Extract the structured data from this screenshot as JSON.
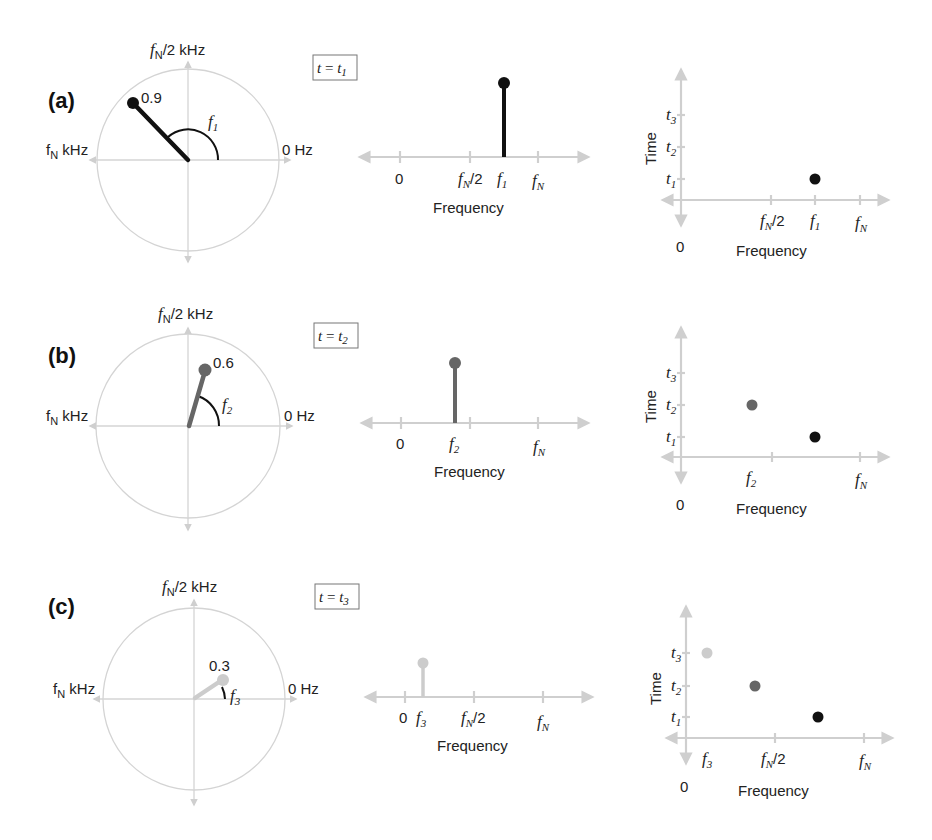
{
  "panels": [
    {
      "id": "a",
      "label": "(a)",
      "time_box": {
        "t": "t",
        "eq": " = ",
        "sub_t": "t",
        "sub": "1"
      },
      "phasor": {
        "top_label_f": "f",
        "top_label_sub": "N",
        "top_label_rest": "/2 kHz",
        "left_label": "f",
        "left_label_sub": "N",
        "left_label_rest": " kHz",
        "right_label": "0 Hz",
        "magnitude": "0.9",
        "angle_label": "f",
        "angle_sub": "1",
        "color": "#111111"
      },
      "spectrum": {
        "ticks": [
          {
            "main": "0",
            "sub": ""
          },
          {
            "main": "f",
            "sub": "N",
            "rest": "/2"
          },
          {
            "main": "f",
            "sub": "1"
          },
          {
            "main": "f",
            "sub": "N"
          }
        ],
        "xlabel": "Frequency"
      },
      "spectrogram": {
        "ylabel": "Time",
        "yticks": [
          {
            "main": "t",
            "sub": "1"
          },
          {
            "main": "t",
            "sub": "2"
          },
          {
            "main": "t",
            "sub": "3"
          }
        ],
        "xticks": [
          {
            "main": "f",
            "sub": "N",
            "rest": "/2"
          },
          {
            "main": "f",
            "sub": "1"
          },
          {
            "main": "f",
            "sub": "N"
          }
        ],
        "origin": "0",
        "xlabel": "Frequency"
      }
    },
    {
      "id": "b",
      "label": "(b)",
      "time_box": {
        "t": "t",
        "eq": " = ",
        "sub_t": "t",
        "sub": "2"
      },
      "phasor": {
        "top_label_f": "f",
        "top_label_sub": "N",
        "top_label_rest": "/2 kHz",
        "left_label": "f",
        "left_label_sub": "N",
        "left_label_rest": " kHz",
        "right_label": "0 Hz",
        "magnitude": "0.6",
        "angle_label": "f",
        "angle_sub": "2",
        "color": "#666666"
      },
      "spectrum": {
        "ticks": [
          {
            "main": "0",
            "sub": ""
          },
          {
            "main": "f",
            "sub": "2"
          },
          {
            "main": "f",
            "sub": "N"
          }
        ],
        "xlabel": "Frequency"
      },
      "spectrogram": {
        "ylabel": "Time",
        "yticks": [
          {
            "main": "t",
            "sub": "1"
          },
          {
            "main": "t",
            "sub": "2"
          },
          {
            "main": "t",
            "sub": "3"
          }
        ],
        "xticks": [
          {
            "main": "f",
            "sub": "2"
          },
          {
            "main": "f",
            "sub": "N"
          }
        ],
        "origin": "0",
        "xlabel": "Frequency"
      }
    },
    {
      "id": "c",
      "label": "(c)",
      "time_box": {
        "t": "t",
        "eq": " = ",
        "sub_t": "t",
        "sub": "3"
      },
      "phasor": {
        "top_label_f": "f",
        "top_label_sub": "N",
        "top_label_rest": "/2 kHz",
        "left_label": "f",
        "left_label_sub": "N",
        "left_label_rest": " kHz",
        "right_label": "0 Hz",
        "magnitude": "0.3",
        "angle_label": "f",
        "angle_sub": "3",
        "color": "#cccccc"
      },
      "spectrum": {
        "ticks": [
          {
            "main": "0",
            "sub": ""
          },
          {
            "main": "f",
            "sub": "3"
          },
          {
            "main": "f",
            "sub": "N",
            "rest": "/2"
          },
          {
            "main": "f",
            "sub": "N"
          }
        ],
        "xlabel": "Frequency"
      },
      "spectrogram": {
        "ylabel": "Time",
        "yticks": [
          {
            "main": "t",
            "sub": "1"
          },
          {
            "main": "t",
            "sub": "2"
          },
          {
            "main": "t",
            "sub": "3"
          }
        ],
        "xticks": [
          {
            "main": "f",
            "sub": "3"
          },
          {
            "main": "f",
            "sub": "N",
            "rest": "/2"
          },
          {
            "main": "f",
            "sub": "N"
          }
        ],
        "origin": "0",
        "xlabel": "Frequency"
      }
    }
  ],
  "colors": {
    "t1": "#111111",
    "t2": "#666666",
    "t3": "#cccccc",
    "axis": "#cfcfcf",
    "circle": "#d4d4d4"
  }
}
